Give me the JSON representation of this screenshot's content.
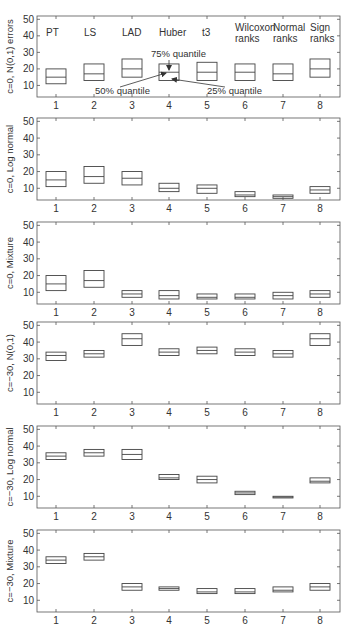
{
  "chart_data": [
    {
      "type": "box",
      "panel_index": 0,
      "ylabel": "c=0, N(0,1) errors",
      "ylim": [
        3,
        52
      ],
      "yticks": [
        10,
        20,
        30,
        40,
        50
      ],
      "categories": [
        "1",
        "2",
        "3",
        "4",
        "5",
        "6",
        "7",
        "8"
      ],
      "method_labels": [
        "PT",
        "LS",
        "LAD",
        "Huber",
        "t3",
        "Wilcoxon ranks",
        "Normal ranks",
        "Sign ranks"
      ],
      "boxes": [
        {
          "q25": 11,
          "median": 15,
          "q75": 20
        },
        {
          "q25": 13,
          "median": 17,
          "q75": 23
        },
        {
          "q25": 15,
          "median": 20,
          "q75": 26
        },
        {
          "q25": 13,
          "median": 18,
          "q75": 23
        },
        {
          "q25": 13,
          "median": 18,
          "q75": 24
        },
        {
          "q25": 13,
          "median": 18,
          "q75": 23
        },
        {
          "q25": 13,
          "median": 17,
          "q75": 23
        },
        {
          "q25": 15,
          "median": 20,
          "q75": 26
        }
      ],
      "annotations": [
        "75% quantile",
        "50% quantile",
        "25% quantile"
      ]
    },
    {
      "type": "box",
      "panel_index": 1,
      "ylabel": "c=0, Log normal",
      "ylim": [
        3,
        52
      ],
      "yticks": [
        10,
        20,
        30,
        40,
        50
      ],
      "categories": [
        "1",
        "2",
        "3",
        "4",
        "5",
        "6",
        "7",
        "8"
      ],
      "boxes": [
        {
          "q25": 11,
          "median": 15,
          "q75": 20
        },
        {
          "q25": 13,
          "median": 17,
          "q75": 23
        },
        {
          "q25": 12,
          "median": 16,
          "q75": 20
        },
        {
          "q25": 8,
          "median": 10,
          "q75": 13
        },
        {
          "q25": 7,
          "median": 10,
          "q75": 12
        },
        {
          "q25": 5,
          "median": 6,
          "q75": 8
        },
        {
          "q25": 4,
          "median": 5,
          "q75": 6
        },
        {
          "q25": 7,
          "median": 9,
          "q75": 11
        }
      ]
    },
    {
      "type": "box",
      "panel_index": 2,
      "ylabel": "c=0, Mixture",
      "ylim": [
        3,
        52
      ],
      "yticks": [
        10,
        20,
        30,
        40,
        50
      ],
      "categories": [
        "1",
        "2",
        "3",
        "4",
        "5",
        "6",
        "7",
        "8"
      ],
      "boxes": [
        {
          "q25": 11,
          "median": 15,
          "q75": 20
        },
        {
          "q25": 13,
          "median": 17,
          "q75": 23
        },
        {
          "q25": 7,
          "median": 9,
          "q75": 11
        },
        {
          "q25": 6,
          "median": 8,
          "q75": 11
        },
        {
          "q25": 6,
          "median": 7,
          "q75": 9
        },
        {
          "q25": 6,
          "median": 7,
          "q75": 9
        },
        {
          "q25": 6,
          "median": 8,
          "q75": 10
        },
        {
          "q25": 7,
          "median": 9,
          "q75": 11
        }
      ]
    },
    {
      "type": "box",
      "panel_index": 3,
      "ylabel": "c=−30, N(0,1)",
      "ylim": [
        3,
        52
      ],
      "yticks": [
        10,
        20,
        30,
        40,
        50
      ],
      "categories": [
        "1",
        "2",
        "3",
        "4",
        "5",
        "6",
        "7",
        "8"
      ],
      "boxes": [
        {
          "q25": 29,
          "median": 32,
          "q75": 34
        },
        {
          "q25": 31,
          "median": 33,
          "q75": 35
        },
        {
          "q25": 38,
          "median": 42,
          "q75": 45
        },
        {
          "q25": 32,
          "median": 34,
          "q75": 36
        },
        {
          "q25": 33,
          "median": 35,
          "q75": 37
        },
        {
          "q25": 32,
          "median": 34,
          "q75": 36
        },
        {
          "q25": 31,
          "median": 33,
          "q75": 35
        },
        {
          "q25": 38,
          "median": 42,
          "q75": 45
        }
      ]
    },
    {
      "type": "box",
      "panel_index": 4,
      "ylabel": "c=−30, Log normal",
      "ylim": [
        3,
        52
      ],
      "yticks": [
        10,
        20,
        30,
        40,
        50
      ],
      "categories": [
        "1",
        "2",
        "3",
        "4",
        "5",
        "6",
        "7",
        "8"
      ],
      "boxes": [
        {
          "q25": 32,
          "median": 34,
          "q75": 36
        },
        {
          "q25": 34,
          "median": 36,
          "q75": 38
        },
        {
          "q25": 32,
          "median": 35,
          "q75": 38
        },
        {
          "q25": 20,
          "median": 21,
          "q75": 23
        },
        {
          "q25": 18,
          "median": 20,
          "q75": 22
        },
        {
          "q25": 11,
          "median": 12,
          "q75": 13
        },
        {
          "q25": 9,
          "median": 9.5,
          "q75": 10
        },
        {
          "q25": 18,
          "median": 19,
          "q75": 21
        }
      ]
    },
    {
      "type": "box",
      "panel_index": 5,
      "ylabel": "c=−30, Mixture",
      "ylim": [
        3,
        52
      ],
      "yticks": [
        10,
        20,
        30,
        40,
        50
      ],
      "categories": [
        "1",
        "2",
        "3",
        "4",
        "5",
        "6",
        "7",
        "8"
      ],
      "boxes": [
        {
          "q25": 32,
          "median": 34,
          "q75": 36
        },
        {
          "q25": 34,
          "median": 36,
          "q75": 38
        },
        {
          "q25": 16,
          "median": 18,
          "q75": 20
        },
        {
          "q25": 16,
          "median": 17,
          "q75": 18
        },
        {
          "q25": 14,
          "median": 15,
          "q75": 17
        },
        {
          "q25": 14,
          "median": 15,
          "q75": 17
        },
        {
          "q25": 15,
          "median": 16,
          "q75": 18
        },
        {
          "q25": 16,
          "median": 18,
          "q75": 20
        }
      ]
    }
  ],
  "panels_layout": [
    {
      "top": 16,
      "bottom": 97
    },
    {
      "top": 118,
      "bottom": 200
    },
    {
      "top": 222,
      "bottom": 304
    },
    {
      "top": 322,
      "bottom": 404
    },
    {
      "top": 426,
      "bottom": 508
    },
    {
      "top": 530,
      "bottom": 612
    }
  ],
  "annotations": {
    "q75": "75% quantile",
    "q50": "50% quantile",
    "q25": "25% quantile"
  },
  "colors": {
    "axis": "#555555",
    "box": "#444444",
    "text": "#333333"
  }
}
